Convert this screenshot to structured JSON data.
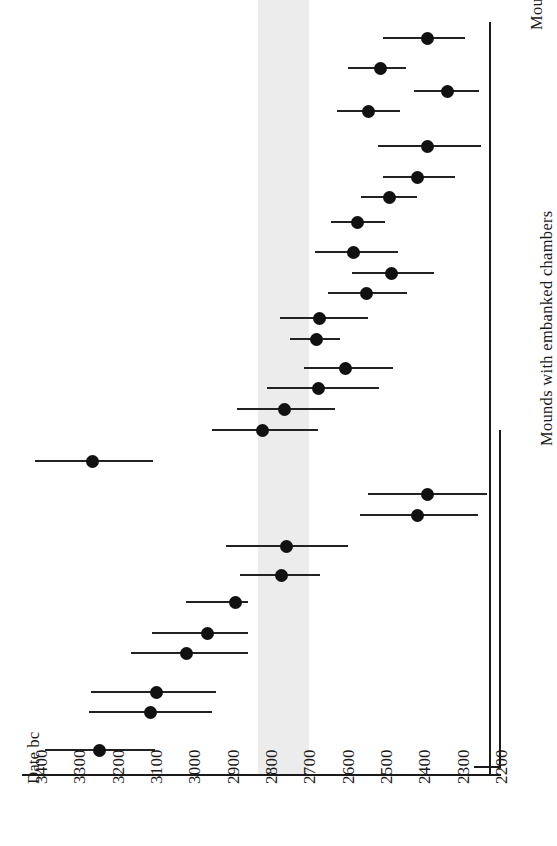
{
  "chart_data": {
    "type": "scatter",
    "title": "",
    "subtitle": "",
    "xlabel": "Date bc",
    "ylabel": "",
    "orientation": "horizontal-ranges",
    "xlim": [
      3400,
      2200
    ],
    "x_axis_reversed": true,
    "grid": false,
    "legend_position": "none",
    "tick_labels": [
      "3400",
      "3300",
      "3200",
      "3100",
      "3000",
      "2900",
      "2800",
      "2700",
      "2600",
      "2500",
      "2400",
      "2300",
      "2200"
    ],
    "tick_values": [
      3400,
      3300,
      3200,
      3100,
      3000,
      2900,
      2800,
      2700,
      2600,
      2500,
      2400,
      2300,
      2200
    ],
    "annotations": [
      {
        "name": "shaded-band",
        "type": "vspan",
        "from": 2832,
        "to": 2697,
        "color": "#e9e9e9"
      }
    ],
    "group_labels": [
      {
        "name": "without-embanked",
        "text": "Mounds without embanked chambers"
      },
      {
        "name": "with-embanked",
        "text": "Mounds with embanked chambers"
      }
    ],
    "groups": [
      {
        "name": "Mounds without embanked chambers",
        "points": [
          {
            "value": 2390,
            "low": 2505,
            "high": 2290
          },
          {
            "value": 2512,
            "low": 2597,
            "high": 2444
          },
          {
            "value": 2338,
            "low": 2425,
            "high": 2256
          },
          {
            "value": 2544,
            "low": 2625,
            "high": 2461
          },
          {
            "value": 2390,
            "low": 2518,
            "high": 2249
          },
          {
            "value": 2416,
            "low": 2505,
            "high": 2317
          },
          {
            "value": 2487,
            "low": 2562,
            "high": 2416
          },
          {
            "value": 2573,
            "low": 2641,
            "high": 2500
          },
          {
            "value": 2583,
            "low": 2683,
            "high": 2466
          },
          {
            "value": 2482,
            "low": 2586,
            "high": 2373
          },
          {
            "value": 2547,
            "low": 2649,
            "high": 2443
          },
          {
            "value": 2670,
            "low": 2774,
            "high": 2544
          },
          {
            "value": 2678,
            "low": 2748,
            "high": 2617
          },
          {
            "value": 2604,
            "low": 2711,
            "high": 2479
          },
          {
            "value": 2673,
            "low": 2808,
            "high": 2516
          },
          {
            "value": 2763,
            "low": 2885,
            "high": 2630
          },
          {
            "value": 2820,
            "low": 2950,
            "high": 2675
          },
          {
            "value": 3262,
            "low": 3413,
            "high": 3105
          }
        ]
      },
      {
        "name": "Mounds with embanked chambers",
        "points": [
          {
            "value": 2388,
            "low": 2544,
            "high": 2233
          },
          {
            "value": 2414,
            "low": 2565,
            "high": 2257
          },
          {
            "value": 2756,
            "low": 2915,
            "high": 2597
          },
          {
            "value": 2769,
            "low": 2879,
            "high": 2670
          },
          {
            "value": 2889,
            "low": 3019,
            "high": 2858
          },
          {
            "value": 2962,
            "low": 3108,
            "high": 2857
          },
          {
            "value": 3017,
            "low": 3162,
            "high": 2858
          },
          {
            "value": 3095,
            "low": 3267,
            "high": 2941
          },
          {
            "value": 3113,
            "low": 3273,
            "high": 2951
          },
          {
            "value": 3246,
            "low": 3387,
            "high": 3100
          }
        ]
      }
    ]
  },
  "axis": {
    "caption": "Date bc"
  }
}
